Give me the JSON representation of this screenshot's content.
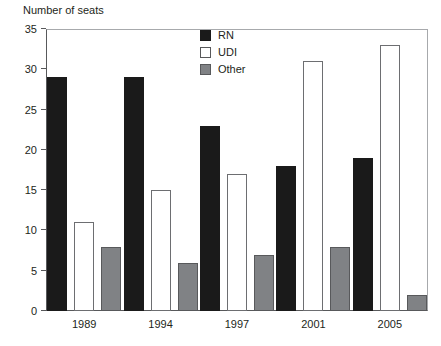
{
  "chart_data": {
    "type": "bar",
    "title": "",
    "ylabel": "Number of seats",
    "xlabel": "",
    "ylim": [
      0,
      35
    ],
    "yticks": [
      0,
      5,
      10,
      15,
      20,
      25,
      30,
      35
    ],
    "grid": false,
    "legend_position": "top-center",
    "categories": [
      "1989",
      "1994",
      "1997",
      "2001",
      "2005"
    ],
    "series": [
      {
        "name": "RN",
        "color": "#1a1a1a",
        "values": [
          29,
          29,
          23,
          18,
          19
        ]
      },
      {
        "name": "UDI",
        "color": "#ffffff",
        "values": [
          11,
          15,
          17,
          31,
          33
        ]
      },
      {
        "name": "Other",
        "color": "#808285",
        "values": [
          8,
          6,
          7,
          8,
          2
        ]
      }
    ]
  },
  "axis": {
    "y_title": "Number of seats",
    "y_tick_labels": [
      "35",
      "30",
      "25",
      "20",
      "15",
      "10",
      "5",
      "0"
    ],
    "x_tick_labels": [
      "1989",
      "1994",
      "1997",
      "2001",
      "2005"
    ]
  },
  "legend": {
    "items": [
      {
        "label": "RN",
        "swatch": "black-square-swatch"
      },
      {
        "label": "UDI",
        "swatch": "white-square-swatch"
      },
      {
        "label": "Other",
        "swatch": "gray-square-swatch"
      }
    ]
  }
}
